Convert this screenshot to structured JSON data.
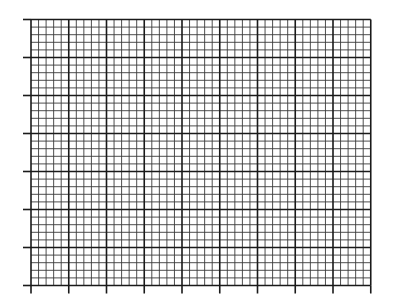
{
  "graph_paper": {
    "origin_x": 31,
    "origin_y": 19.5,
    "major_cols": 9,
    "major_rows": 7,
    "major_size_x": 37.75,
    "major_size_y": 38.0,
    "minor_per_major": 5,
    "tick_length": 8,
    "colors": {
      "background": "#ffffff",
      "major_line": "#1a1a1a",
      "minor_line": "#3a3a3a"
    },
    "major_line_width": 1.6,
    "minor_line_width": 0.9
  }
}
